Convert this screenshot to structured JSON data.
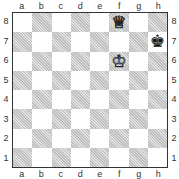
{
  "files": [
    "a",
    "b",
    "c",
    "d",
    "e",
    "f",
    "g",
    "h"
  ],
  "ranks": [
    "8",
    "7",
    "6",
    "5",
    "4",
    "3",
    "2",
    "1"
  ],
  "pieces": [
    {
      "square": "f8",
      "color": "white",
      "type": "queen",
      "glyph": "♕"
    },
    {
      "square": "h7",
      "color": "black",
      "type": "king",
      "glyph": "♚"
    },
    {
      "square": "f6",
      "color": "white",
      "type": "king",
      "glyph": "♔"
    }
  ],
  "colors": {
    "light_square": "#ffffff",
    "dark_square": "#d4d4d4",
    "border": "#333333"
  }
}
